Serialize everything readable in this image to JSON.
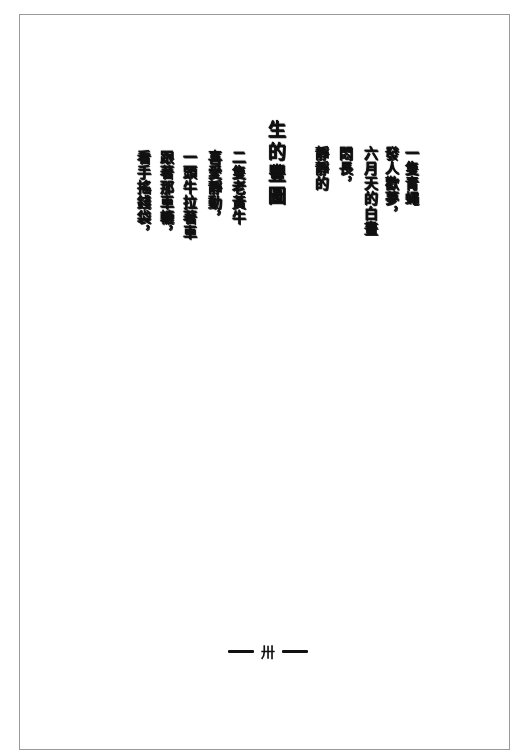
{
  "page": {
    "border_color": "#9a9a9a",
    "ink_color": "#111111",
    "background": "#ffffff"
  },
  "poem_before": {
    "columns": [
      "一隻青蠅",
      "發人歡夢，",
      "六月天的白晝",
      "悶長，",
      "靜靜的"
    ]
  },
  "title": {
    "text": "生的豐圖"
  },
  "poem_after": {
    "columns": [
      "二隻老黃牛",
      "喜愛靜動，",
      "一頭牛拉著車",
      "跟著那車轆，",
      "看手搖錢袋，"
    ]
  },
  "footer": {
    "page_number": "卅",
    "dash_left": "—",
    "dash_right": "—"
  }
}
